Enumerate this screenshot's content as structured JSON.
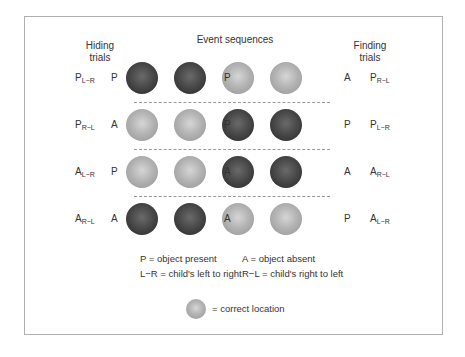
{
  "header": {
    "hiding": "Hiding\ntrials",
    "hiding_line1": "Hiding",
    "hiding_line2": "trials",
    "events": "Event sequences",
    "finding_line1": "Finding",
    "finding_line2": "trials"
  },
  "rows": [
    {
      "hide_main": "P",
      "hide_sub": "L−R",
      "first": "P",
      "mid": "P",
      "last": "A",
      "find_main": "P",
      "find_sub": "R−L",
      "balls": [
        "dark",
        "dark",
        "light",
        "light"
      ]
    },
    {
      "hide_main": "P",
      "hide_sub": "R−L",
      "first": "A",
      "mid": "P",
      "last": "P",
      "find_main": "P",
      "find_sub": "L−R",
      "balls": [
        "light",
        "light",
        "dark",
        "dark"
      ]
    },
    {
      "hide_main": "A",
      "hide_sub": "L−R",
      "first": "P",
      "mid": "A",
      "last": "A",
      "find_main": "A",
      "find_sub": "R−L",
      "balls": [
        "light",
        "light",
        "dark",
        "dark"
      ]
    },
    {
      "hide_main": "A",
      "hide_sub": "R−L",
      "first": "A",
      "mid": "A",
      "last": "P",
      "find_main": "A",
      "find_sub": "L−R",
      "balls": [
        "dark",
        "dark",
        "light",
        "light"
      ]
    }
  ],
  "legend": {
    "p": "P = object present",
    "a": "A = object absent",
    "lr": "L−R = child's left to right",
    "rl": "R−L = child's right to left",
    "correct": "= correct location"
  },
  "colors": {
    "dark_ball": "#3a3a3a",
    "light_ball": "#a8a8a8",
    "frame": "#b0b0b0"
  }
}
